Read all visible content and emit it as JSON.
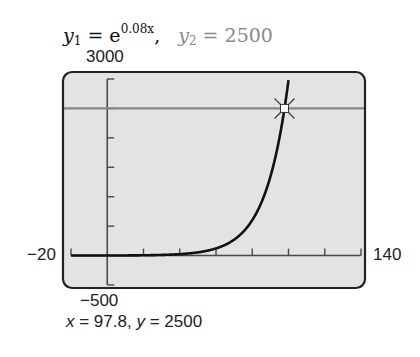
{
  "title": {
    "y1_lhs": "y",
    "y1_sub": "1",
    "y1_eq": " = e",
    "y1_exp": "0.08x",
    "separator": ",",
    "y2_lhs": "y",
    "y2_sub": "2",
    "y2_eq": " = 2500"
  },
  "window": {
    "ymax_label": "3000",
    "ymin_label": "−500",
    "xmin_label": "−20",
    "xmax_label": "140"
  },
  "result": {
    "x_name": "x",
    "x_eq": " = 97.8,  ",
    "y_name": "y",
    "y_eq": " = 2500"
  },
  "colors": {
    "screen_bg": "#e3e3e3",
    "frame": "#222222",
    "axis": "#4a4a4a",
    "curve": "#111111",
    "hline": "#858585"
  },
  "chart_data": {
    "type": "line",
    "xlabel": "",
    "ylabel": "",
    "xlim": [
      -20,
      140
    ],
    "ylim": [
      -500,
      3000
    ],
    "x_tick_step": 20,
    "y_tick_step": 500,
    "grid": false,
    "series": [
      {
        "name": "y1",
        "expression": "e^(0.08x)",
        "k": 0.08,
        "x_start": -20,
        "x_end": 100.08
      },
      {
        "name": "y2",
        "expression": "2500",
        "constant": 2500
      }
    ],
    "intersection": {
      "x": 97.8,
      "y": 2500
    },
    "annotations": [
      "x = 97.8,  y = 2500"
    ]
  }
}
